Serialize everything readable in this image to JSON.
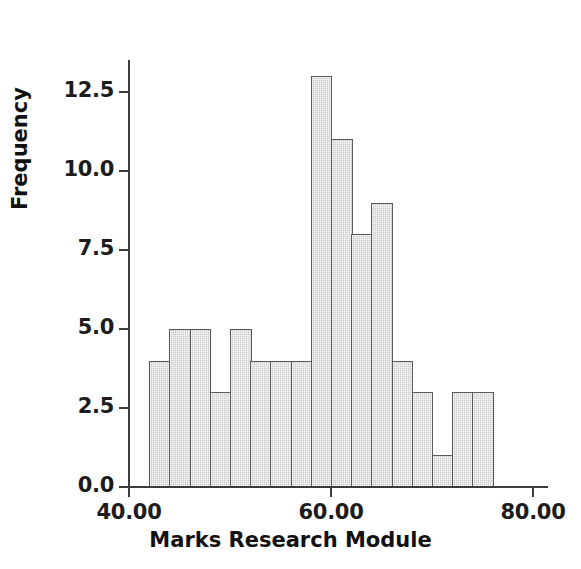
{
  "chart_data": {
    "type": "bar",
    "title": "",
    "subtitle": "",
    "xlabel": "Marks Research Module",
    "ylabel": "Frequency",
    "xlim": [
      38,
      82
    ],
    "ylim": [
      0,
      13.8
    ],
    "grid": false,
    "legend": null,
    "bin_width": 2,
    "bin_starts": [
      42,
      44,
      46,
      48,
      50,
      52,
      54,
      56,
      58,
      60,
      62,
      64,
      66,
      68,
      70,
      72,
      74
    ],
    "bin_ends": [
      44,
      46,
      48,
      50,
      52,
      54,
      56,
      58,
      60,
      62,
      64,
      66,
      68,
      70,
      72,
      74,
      76
    ],
    "categories": [
      "42-44",
      "44-46",
      "46-48",
      "48-50",
      "50-52",
      "52-54",
      "54-56",
      "56-58",
      "58-60",
      "60-62",
      "62-64",
      "64-66",
      "66-68",
      "68-70",
      "70-72",
      "72-74",
      "74-76"
    ],
    "values": [
      4,
      5,
      5,
      3,
      5,
      4,
      4,
      4,
      13,
      11,
      8,
      9,
      4,
      3,
      1,
      3,
      3
    ],
    "total_count": 79,
    "x_ticks": [
      {
        "value": 40,
        "label": "40.00"
      },
      {
        "value": 60,
        "label": "60.00"
      },
      {
        "value": 80,
        "label": "80.00"
      }
    ],
    "y_ticks": [
      {
        "value": 0.0,
        "label": "0.0"
      },
      {
        "value": 2.5,
        "label": "2.5"
      },
      {
        "value": 5.0,
        "label": "5.0"
      },
      {
        "value": 7.5,
        "label": "7.5"
      },
      {
        "value": 10.0,
        "label": "10.0"
      },
      {
        "value": 12.5,
        "label": "12.5"
      }
    ],
    "colors": {
      "bar_fill": "#c9c9c9",
      "bar_border": "#5a5a5a",
      "axis": "#3b3b3b",
      "text": "#111111",
      "background": "#ffffff"
    }
  }
}
